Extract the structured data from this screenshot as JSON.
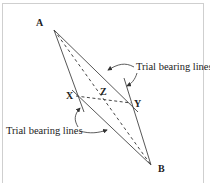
{
  "diagram": {
    "points": {
      "A": {
        "label": "A"
      },
      "B": {
        "label": "B"
      },
      "X": {
        "label": "X"
      },
      "Y": {
        "label": "Y"
      },
      "Z": {
        "label": "Z"
      }
    },
    "captions": {
      "top_right": "Trial bearing lines",
      "bottom_left": "Trial bearing lines"
    },
    "colors": {
      "line": "#333333",
      "frame": "#cfcfcf",
      "background": "#ffffff"
    }
  }
}
